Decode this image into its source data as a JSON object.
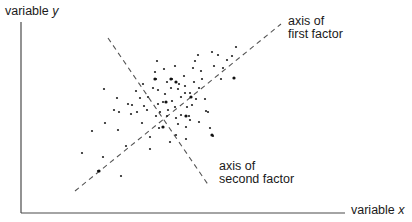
{
  "chart_data": {
    "type": "scatter",
    "title": "",
    "xlabel": "variable x",
    "ylabel": "variable y",
    "x_axis_label_text": "variable",
    "x_axis_label_var": "x",
    "y_axis_label_text": "variable",
    "y_axis_label_var": "y",
    "grid": false,
    "legend": null,
    "annotations": [
      {
        "id": "first_factor",
        "line1": "axis of",
        "line2": "first factor",
        "line": {
          "x1": 75,
          "y1": 191,
          "x2": 281,
          "y2": 24,
          "style": "dashed"
        }
      },
      {
        "id": "second_factor",
        "line1": "axis of",
        "line2": "second factor",
        "line": {
          "x1": 108,
          "y1": 38,
          "x2": 209,
          "y2": 186,
          "style": "dashed"
        }
      }
    ],
    "axes": {
      "origin": [
        21,
        213
      ],
      "y_top": 22,
      "x_right": 345
    },
    "points": [
      [
        104,
        89
      ],
      [
        82,
        153
      ],
      [
        92,
        131
      ],
      [
        114,
        110
      ],
      [
        105,
        123
      ],
      [
        131,
        114
      ],
      [
        119,
        112
      ],
      [
        118,
        130
      ],
      [
        103,
        157
      ],
      [
        98,
        171
      ],
      [
        121,
        176
      ],
      [
        126,
        146
      ],
      [
        117,
        98
      ],
      [
        128,
        104
      ],
      [
        140,
        98
      ],
      [
        142,
        123
      ],
      [
        147,
        110
      ],
      [
        150,
        137
      ],
      [
        158,
        90
      ],
      [
        158,
        104
      ],
      [
        156,
        116
      ],
      [
        157,
        61
      ],
      [
        172,
        79
      ],
      [
        175,
        66
      ],
      [
        156,
        79
      ],
      [
        167,
        82
      ],
      [
        165,
        94
      ],
      [
        168,
        110
      ],
      [
        163,
        127
      ],
      [
        176,
        135
      ],
      [
        178,
        124
      ],
      [
        172,
        101
      ],
      [
        185,
        93
      ],
      [
        184,
        76
      ],
      [
        193,
        68
      ],
      [
        195,
        61
      ],
      [
        199,
        88
      ],
      [
        196,
        99
      ],
      [
        189,
        116
      ],
      [
        186,
        139
      ],
      [
        202,
        79
      ],
      [
        205,
        99
      ],
      [
        208,
        112
      ],
      [
        201,
        71
      ],
      [
        187,
        107
      ],
      [
        181,
        115
      ],
      [
        212,
        52
      ],
      [
        218,
        55
      ],
      [
        223,
        68
      ],
      [
        232,
        56
      ],
      [
        236,
        47
      ],
      [
        206,
        111
      ],
      [
        179,
        84
      ],
      [
        163,
        102
      ],
      [
        153,
        88
      ],
      [
        167,
        116
      ],
      [
        175,
        107
      ],
      [
        192,
        105
      ],
      [
        181,
        97
      ],
      [
        194,
        82
      ],
      [
        171,
        88
      ],
      [
        176,
        118
      ],
      [
        148,
        97
      ],
      [
        185,
        86
      ],
      [
        190,
        93
      ],
      [
        198,
        55
      ],
      [
        164,
        69
      ],
      [
        155,
        72
      ],
      [
        214,
        66
      ],
      [
        227,
        60
      ],
      [
        221,
        79
      ],
      [
        199,
        122
      ],
      [
        137,
        112
      ],
      [
        132,
        105
      ],
      [
        144,
        106
      ],
      [
        159,
        128
      ],
      [
        170,
        142
      ],
      [
        150,
        149
      ],
      [
        190,
        120
      ],
      [
        210,
        128
      ],
      [
        213,
        136
      ],
      [
        143,
        84
      ],
      [
        136,
        91
      ],
      [
        186,
        127
      ],
      [
        160,
        112
      ],
      [
        178,
        89
      ]
    ],
    "large_points": [
      [
        155,
        79
      ],
      [
        171,
        79
      ],
      [
        176,
        82
      ],
      [
        163,
        127
      ],
      [
        186,
        116
      ],
      [
        99,
        171
      ],
      [
        191,
        97
      ],
      [
        234,
        78
      ],
      [
        212,
        135
      ],
      [
        166,
        102
      ]
    ]
  }
}
